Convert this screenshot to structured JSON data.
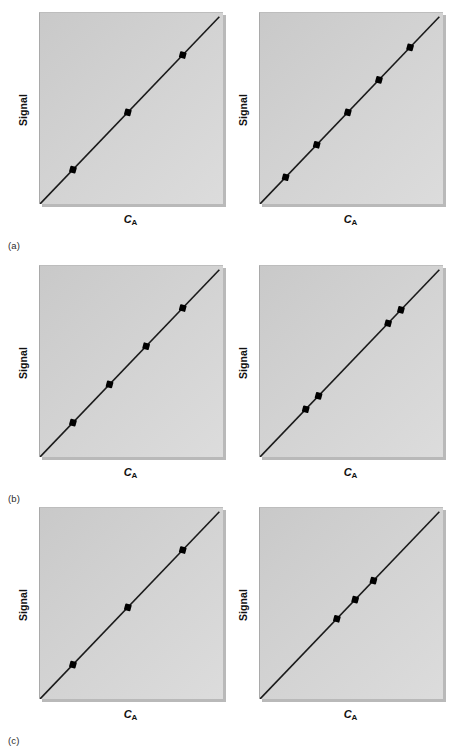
{
  "figure": {
    "background_color": "#ffffff",
    "plot_background_color": "#d2d2d2",
    "line_color": "#1a1a1a",
    "marker_color": "#000000",
    "rows": [
      {
        "key": "a",
        "label": "(a)"
      },
      {
        "key": "b",
        "label": "(b)"
      },
      {
        "key": "c",
        "label": "(c)"
      }
    ]
  },
  "axes": {
    "ylabel": "Signal",
    "xlabel_symbol": "C",
    "xlabel_subscript": "A",
    "xlabel_text": "CA"
  },
  "chart_data": [
    {
      "id": "a-left",
      "type": "scatter",
      "title": "",
      "xlabel": "CA",
      "ylabel": "Signal",
      "xlim": [
        0,
        1
      ],
      "ylim": [
        0,
        1
      ],
      "grid": false,
      "legend": "none",
      "axis_ticks": "none",
      "line": {
        "name": "calibration line",
        "x": [
          0.0,
          0.98
        ],
        "y": [
          0.0,
          0.98
        ]
      },
      "x": [
        0.18,
        0.48,
        0.78
      ],
      "y": [
        0.18,
        0.48,
        0.78
      ],
      "n_points": 3,
      "spacing": "wide, evenly spread across full range"
    },
    {
      "id": "a-right",
      "type": "scatter",
      "title": "",
      "xlabel": "CA",
      "ylabel": "Signal",
      "xlim": [
        0,
        1
      ],
      "ylim": [
        0,
        1
      ],
      "grid": false,
      "legend": "none",
      "axis_ticks": "none",
      "line": {
        "name": "calibration line",
        "x": [
          0.0,
          0.98
        ],
        "y": [
          0.0,
          0.98
        ]
      },
      "x": [
        0.14,
        0.31,
        0.48,
        0.65,
        0.82
      ],
      "y": [
        0.14,
        0.31,
        0.48,
        0.65,
        0.82
      ],
      "n_points": 5,
      "spacing": "evenly spread across full range"
    },
    {
      "id": "b-left",
      "type": "scatter",
      "title": "",
      "xlabel": "CA",
      "ylabel": "Signal",
      "xlim": [
        0,
        1
      ],
      "ylim": [
        0,
        1
      ],
      "grid": false,
      "legend": "none",
      "axis_ticks": "none",
      "line": {
        "name": "calibration line",
        "x": [
          0.0,
          0.98
        ],
        "y": [
          0.0,
          0.98
        ]
      },
      "x": [
        0.18,
        0.38,
        0.58,
        0.78
      ],
      "y": [
        0.18,
        0.38,
        0.58,
        0.78
      ],
      "n_points": 4,
      "spacing": "evenly spread across full range"
    },
    {
      "id": "b-right",
      "type": "scatter",
      "title": "",
      "xlabel": "CA",
      "ylabel": "Signal",
      "xlim": [
        0,
        1
      ],
      "ylim": [
        0,
        1
      ],
      "grid": false,
      "legend": "none",
      "axis_ticks": "none",
      "line": {
        "name": "calibration line",
        "x": [
          0.0,
          0.98
        ],
        "y": [
          0.0,
          0.98
        ]
      },
      "x": [
        0.25,
        0.32,
        0.7,
        0.77
      ],
      "y": [
        0.25,
        0.32,
        0.7,
        0.77
      ],
      "n_points": 4,
      "spacing": "two tight clusters of two, one low and one high"
    },
    {
      "id": "c-left",
      "type": "scatter",
      "title": "",
      "xlabel": "CA",
      "ylabel": "Signal",
      "xlim": [
        0,
        1
      ],
      "ylim": [
        0,
        1
      ],
      "grid": false,
      "legend": "none",
      "axis_ticks": "none",
      "line": {
        "name": "calibration line",
        "x": [
          0.0,
          0.98
        ],
        "y": [
          0.0,
          0.98
        ]
      },
      "x": [
        0.18,
        0.48,
        0.78
      ],
      "y": [
        0.18,
        0.48,
        0.78
      ],
      "n_points": 3,
      "spacing": "wide, evenly spread across full range"
    },
    {
      "id": "c-right",
      "type": "scatter",
      "title": "",
      "xlabel": "CA",
      "ylabel": "Signal",
      "xlim": [
        0,
        1
      ],
      "ylim": [
        0,
        1
      ],
      "grid": false,
      "legend": "none",
      "axis_ticks": "none",
      "line": {
        "name": "calibration line",
        "x": [
          0.0,
          0.98
        ],
        "y": [
          0.0,
          0.98
        ]
      },
      "x": [
        0.42,
        0.52,
        0.62
      ],
      "y": [
        0.42,
        0.52,
        0.62
      ],
      "n_points": 3,
      "spacing": "tight cluster near the middle of the range"
    }
  ]
}
